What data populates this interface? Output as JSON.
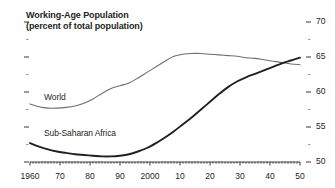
{
  "chart_data": {
    "type": "line",
    "title": "Working-Age Population",
    "subtitle": "(percent of total population)",
    "xlabel": "",
    "ylabel": "",
    "xlim": [
      1960,
      2050
    ],
    "ylim": [
      50,
      70
    ],
    "grid": false,
    "legend_position": "inline-annotation",
    "y_ticks": [
      70,
      65,
      60,
      55,
      50
    ],
    "y_tick_labels": [
      "70",
      "65",
      "60",
      "55",
      "50"
    ],
    "y_minor_ticks": [
      67.5,
      62.5,
      57.5,
      52.5
    ],
    "x_ticks": [
      1960,
      1970,
      1980,
      1990,
      2000,
      2010,
      2020,
      2030,
      2040,
      2050
    ],
    "x_tick_labels": [
      "1960",
      "70",
      "80",
      "90",
      "2000",
      "10",
      "20",
      "30",
      "40",
      "50"
    ],
    "series": [
      {
        "name": "World",
        "color": "#6d6e70",
        "x": [
          1960,
          1963,
          1966,
          1969,
          1972,
          1975,
          1978,
          1981,
          1984,
          1987,
          1990,
          1993,
          1996,
          1999,
          2002,
          2005,
          2008,
          2011,
          2014,
          2017,
          2020,
          2023,
          2026,
          2029,
          2032,
          2035,
          2038,
          2041,
          2044,
          2047,
          2050
        ],
        "values": [
          58.3,
          57.9,
          57.7,
          57.7,
          57.8,
          58.0,
          58.4,
          59.0,
          59.8,
          60.5,
          60.9,
          61.3,
          62.0,
          62.8,
          63.6,
          64.4,
          65.1,
          65.4,
          65.5,
          65.5,
          65.4,
          65.3,
          65.2,
          65.1,
          64.9,
          64.8,
          64.6,
          64.4,
          64.2,
          64.0,
          63.9
        ]
      },
      {
        "name": "Sub-Saharan Africa",
        "color": "#231f20",
        "x": [
          1960,
          1963,
          1966,
          1969,
          1972,
          1975,
          1978,
          1981,
          1984,
          1987,
          1990,
          1993,
          1996,
          1999,
          2002,
          2005,
          2008,
          2011,
          2014,
          2017,
          2020,
          2023,
          2026,
          2029,
          2032,
          2035,
          2038,
          2041,
          2044,
          2047,
          2050
        ],
        "values": [
          52.7,
          52.2,
          51.8,
          51.5,
          51.3,
          51.1,
          51.0,
          50.9,
          50.8,
          50.8,
          50.9,
          51.1,
          51.5,
          52.0,
          52.7,
          53.5,
          54.4,
          55.4,
          56.4,
          57.5,
          58.6,
          59.7,
          60.7,
          61.5,
          62.1,
          62.6,
          63.1,
          63.6,
          64.1,
          64.5,
          64.9
        ]
      }
    ],
    "annotations": [
      {
        "text": "World",
        "x": 1975,
        "y": 60.5
      },
      {
        "text": "Sub-Saharan Africa",
        "x": 1975,
        "y": 55.2
      }
    ]
  }
}
